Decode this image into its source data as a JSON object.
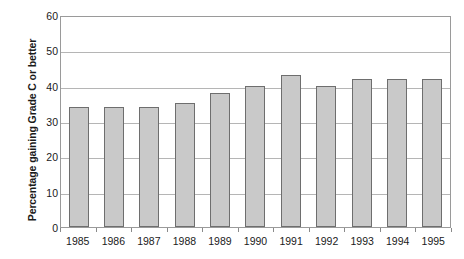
{
  "chart_data": {
    "type": "bar",
    "title": "",
    "subtitle": "",
    "xlabel": "",
    "ylabel": "Percentage gaining Grade C or better",
    "categories": [
      "1985",
      "1986",
      "1987",
      "1988",
      "1989",
      "1990",
      "1991",
      "1992",
      "1993",
      "1994",
      "1995"
    ],
    "values": [
      34,
      34,
      34,
      35,
      38,
      40,
      43,
      40,
      42,
      42,
      42
    ],
    "ylim": [
      0,
      60
    ],
    "ytick_labels": [
      "0",
      "10",
      "20",
      "30",
      "40",
      "50",
      "60"
    ],
    "ytick_values": [
      0,
      10,
      20,
      30,
      40,
      50,
      60
    ],
    "grid": "horizontal",
    "legend": "none",
    "bar_fill_color": "#c9c9c9",
    "bar_border_color": "#6e6e6e",
    "gridline_color": "#b5b5b5",
    "axis_color": "#9a9a9a",
    "background_color": "#ffffff"
  }
}
